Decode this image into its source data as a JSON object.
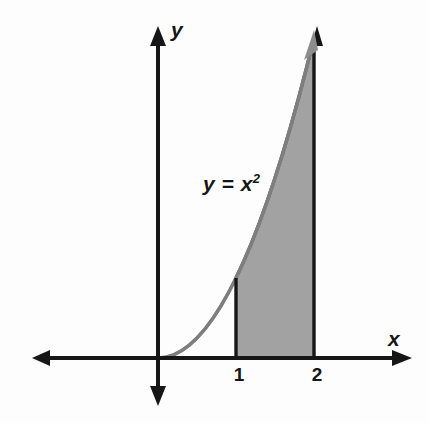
{
  "figure": {
    "background_color": "#fdfdfd"
  },
  "axes": {
    "x_label": "x",
    "y_label": "y",
    "axis_color": "#161616",
    "origin": {
      "x": 158,
      "y": 358
    },
    "x_axis": {
      "left_end": 32,
      "right_end": 410,
      "arrows": "both"
    },
    "y_axis": {
      "top_end": 27,
      "bottom_end": 405,
      "arrows": "both"
    }
  },
  "ticks": {
    "x": [
      {
        "label": "1",
        "value": 1,
        "px": 239
      },
      {
        "label": "2",
        "value": 2,
        "px": 317
      }
    ]
  },
  "annotations": {
    "equation": {
      "lhs": "y",
      "relation": "=",
      "base": "x",
      "exponent": "2"
    }
  },
  "chart_data": {
    "type": "area",
    "title": "",
    "xlabel": "x",
    "ylabel": "y",
    "function": "y = x^2",
    "curve_color": "#7e7e7e",
    "fill_color": "#a2a2a2",
    "boundary_color": "#161616",
    "shaded_region": {
      "from": 1,
      "to": 2,
      "lower": 0,
      "upper_curve": "x^2",
      "label": "y = x²"
    },
    "grid": false,
    "legend": "none",
    "xlim": [
      -1.6,
      3.2
    ],
    "ylim": [
      -0.75,
      4.2
    ],
    "x": [
      0,
      0.1,
      0.2,
      0.3,
      0.4,
      0.5,
      0.6,
      0.7,
      0.8,
      0.9,
      1,
      1.1,
      1.2,
      1.3,
      1.4,
      1.5,
      1.6,
      1.7,
      1.8,
      1.9,
      2
    ],
    "values": [
      0,
      0.01,
      0.04,
      0.09,
      0.16,
      0.25,
      0.36,
      0.49,
      0.64,
      0.81,
      1,
      1.21,
      1.44,
      1.69,
      1.96,
      2.25,
      2.56,
      2.89,
      3.24,
      3.61,
      4
    ],
    "annotations": [
      {
        "text": "y = x²",
        "x": 0.6,
        "y": 2.35
      }
    ]
  }
}
